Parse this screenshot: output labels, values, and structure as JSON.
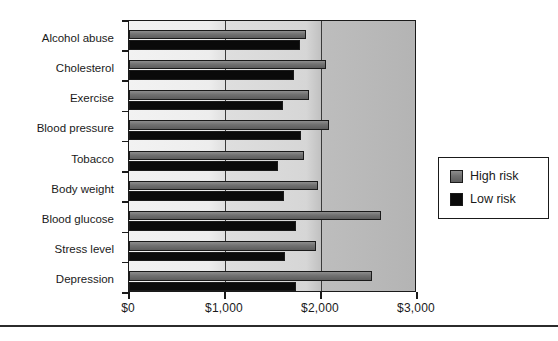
{
  "chart_data": {
    "type": "bar",
    "orientation": "horizontal",
    "title": "",
    "subtitle": "",
    "xlabel": "",
    "ylabel": "",
    "xlim": [
      0,
      3000
    ],
    "ylim": null,
    "grid": true,
    "gridlines_x": [
      1000,
      2000
    ],
    "axis_tick_labels": [
      "$0",
      "$1,000",
      "$2,000",
      "$3,000"
    ],
    "axis_tick_values": [
      0,
      1000,
      2000,
      3000
    ],
    "categories": [
      "Alcohol abuse",
      "Cholesterol",
      "Exercise",
      "Blood pressure",
      "Tobacco",
      "Body weight",
      "Blood glucose",
      "Stress level",
      "Depression"
    ],
    "series": [
      {
        "name": "High risk",
        "color": "#6f6f6f",
        "values": [
          1840,
          2050,
          1870,
          2080,
          1820,
          1970,
          2620,
          1950,
          2530
        ]
      },
      {
        "name": "Low risk",
        "color": "#0a0a0a",
        "values": [
          1780,
          1720,
          1600,
          1790,
          1550,
          1610,
          1740,
          1620,
          1740
        ]
      }
    ],
    "legend": {
      "position": "right",
      "entries": [
        {
          "label": "High risk",
          "swatch": "high"
        },
        {
          "label": "Low risk",
          "swatch": "low"
        }
      ]
    }
  }
}
